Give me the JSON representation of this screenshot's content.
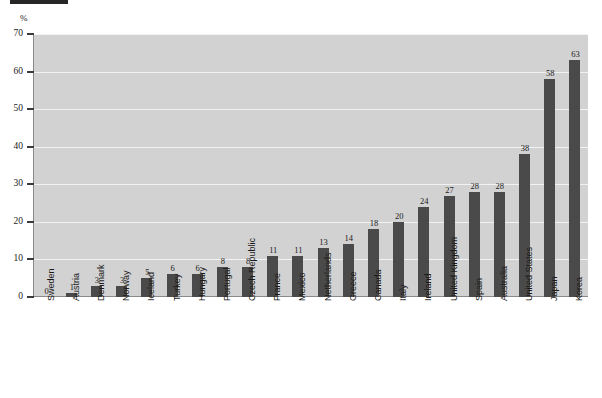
{
  "figure": {
    "unit_label": "%",
    "header_bar": "redacted-header-bar"
  },
  "chart_data": {
    "type": "bar",
    "title": "",
    "subtitle": "",
    "xlabel": "",
    "ylabel": "%",
    "ylim": [
      0,
      70
    ],
    "yticks": [
      0,
      10,
      20,
      30,
      40,
      50,
      60,
      70
    ],
    "grid": true,
    "legend": null,
    "bar_color": "#4a4a4a",
    "plot_background": "#d2d2d2",
    "gridline_color": "#f2f2f2",
    "data_labels": true,
    "categories": [
      "Sweden",
      "Austria",
      "Denmark",
      "Norway",
      "Iceland",
      "Turkey",
      "Hungary",
      "Portugal",
      "Czech Republic",
      "France",
      "Mexico",
      "Netherlands",
      "Greece",
      "Canada",
      "Italy",
      "Ireland",
      "United Kingdom",
      "Spain",
      "Australia",
      "United States",
      "Japan",
      "Korea"
    ],
    "values": [
      0,
      1,
      3,
      3,
      5,
      6,
      6,
      8,
      8,
      11,
      11,
      13,
      14,
      18,
      20,
      24,
      27,
      28,
      28,
      38,
      58,
      63
    ]
  }
}
